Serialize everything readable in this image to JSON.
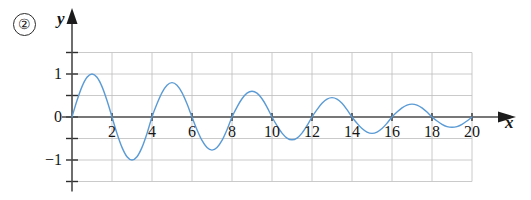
{
  "figure": {
    "index_label": "②",
    "x_axis_label": "x",
    "y_axis_label": "y"
  },
  "chart_data": {
    "type": "line",
    "title": "",
    "subtitle": "",
    "xlabel": "x",
    "ylabel": "y",
    "xlim": [
      0,
      20
    ],
    "ylim": [
      -1.5,
      1.5
    ],
    "grid": true,
    "legend": null,
    "xticks": [
      2,
      4,
      6,
      8,
      10,
      12,
      14,
      16,
      18,
      20
    ],
    "xtick_labels": [
      "2",
      "4",
      "6",
      "8",
      "10",
      "12",
      "14",
      "16",
      "18",
      "20"
    ],
    "yticks": [
      1,
      0,
      -1
    ],
    "ytick_labels": [
      "1",
      "0",
      "−1"
    ],
    "y_minor_ticks": [
      1.5,
      0.5,
      -0.5,
      -1.5
    ],
    "gridlines_x": [
      2,
      4,
      6,
      8,
      10,
      12,
      14,
      16,
      18,
      20
    ],
    "gridlines_y": [
      1.5,
      1.0,
      0.5,
      -0.5,
      -1.0,
      -1.5
    ],
    "series": [
      {
        "name": "damped oscillation",
        "color": "#5b9bd5",
        "line_width": 1.4,
        "extrema": [
          {
            "x": 1,
            "y": 1.0,
            "kind": "peak"
          },
          {
            "x": 3,
            "y": -1.0,
            "kind": "trough"
          },
          {
            "x": 5,
            "y": 0.8,
            "kind": "peak"
          },
          {
            "x": 7,
            "y": -0.77,
            "kind": "trough"
          },
          {
            "x": 9,
            "y": 0.6,
            "kind": "peak"
          },
          {
            "x": 11,
            "y": -0.53,
            "kind": "trough"
          },
          {
            "x": 13,
            "y": 0.45,
            "kind": "peak"
          },
          {
            "x": 15,
            "y": -0.38,
            "kind": "trough"
          },
          {
            "x": 17,
            "y": 0.3,
            "kind": "peak"
          },
          {
            "x": 19,
            "y": -0.24,
            "kind": "trough"
          }
        ],
        "zeros": [
          0,
          2,
          4,
          6,
          8,
          10,
          12,
          14,
          16,
          18,
          20
        ],
        "x": [
          0,
          0.25,
          0.5,
          0.75,
          1,
          1.25,
          1.5,
          1.75,
          2,
          2.25,
          2.5,
          2.75,
          3,
          3.25,
          3.5,
          3.75,
          4,
          4.25,
          4.5,
          4.75,
          5,
          5.25,
          5.5,
          5.75,
          6,
          6.25,
          6.5,
          6.75,
          7,
          7.25,
          7.5,
          7.75,
          8,
          8.25,
          8.5,
          8.75,
          9,
          9.25,
          9.5,
          9.75,
          10,
          10.25,
          10.5,
          10.75,
          11,
          11.25,
          11.5,
          11.75,
          12,
          12.25,
          12.5,
          12.75,
          13,
          13.25,
          13.5,
          13.75,
          14,
          14.25,
          14.5,
          14.75,
          15,
          15.25,
          15.5,
          15.75,
          16,
          16.25,
          16.5,
          16.75,
          17,
          17.25,
          17.5,
          17.75,
          18,
          18.25,
          18.5,
          18.75,
          19,
          19.25,
          19.5,
          19.75,
          20
        ],
        "y": [
          0,
          0.383,
          0.707,
          0.924,
          1.0,
          0.924,
          0.707,
          0.383,
          0,
          -0.383,
          -0.707,
          -0.924,
          -1.0,
          -0.924,
          -0.707,
          -0.383,
          0,
          0.306,
          0.566,
          0.739,
          0.8,
          0.739,
          0.566,
          0.306,
          0,
          -0.295,
          -0.545,
          -0.711,
          -0.77,
          -0.711,
          -0.545,
          -0.295,
          0,
          0.23,
          0.424,
          0.554,
          0.6,
          0.554,
          0.424,
          0.23,
          0,
          -0.203,
          -0.375,
          -0.49,
          -0.53,
          -0.49,
          -0.375,
          -0.203,
          0,
          0.172,
          0.318,
          0.416,
          0.45,
          0.416,
          0.318,
          0.172,
          0,
          -0.145,
          -0.269,
          -0.351,
          -0.38,
          -0.351,
          -0.269,
          -0.145,
          0,
          0.115,
          0.212,
          0.277,
          0.3,
          0.277,
          0.212,
          0.115,
          0,
          -0.092,
          -0.17,
          -0.222,
          -0.24,
          -0.222,
          -0.17,
          -0.092,
          0
        ]
      }
    ]
  }
}
